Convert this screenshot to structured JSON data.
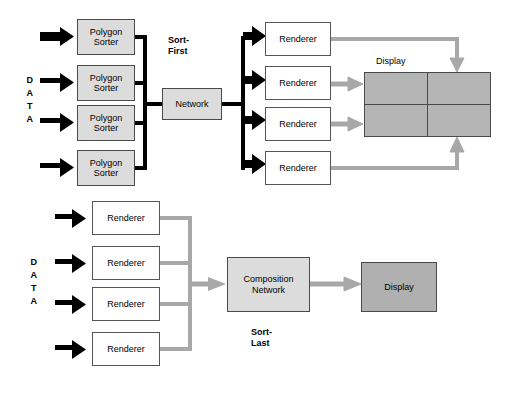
{
  "diagram": {
    "title_hidden": "",
    "colors": {
      "gray_fill": "#dcdcdc",
      "dark_gray_fill": "#b0b0b0",
      "white_fill": "#ffffff",
      "black_arrow": "#000000",
      "gray_arrow": "#a8a8a8",
      "border": "#4a4a4a"
    },
    "sort_first": {
      "label": "Sort-\nFirst",
      "label_line1": "Sort-",
      "label_line2": "First",
      "data_label": "D\nA\nT\nA",
      "data_letters": [
        "D",
        "A",
        "T",
        "A"
      ],
      "polygon_sorters": [
        {
          "line1": "Polygon",
          "line2": "Sorter"
        },
        {
          "line1": "Polygon",
          "line2": "Sorter"
        },
        {
          "line1": "Polygon",
          "line2": "Sorter"
        },
        {
          "line1": "Polygon",
          "line2": "Sorter"
        }
      ],
      "network": {
        "label": "Network"
      },
      "renderers": [
        {
          "label": "Renderer"
        },
        {
          "label": "Renderer"
        },
        {
          "label": "Renderer"
        },
        {
          "label": "Renderer"
        }
      ],
      "display": {
        "label": "Display",
        "tiles": 4,
        "rows": 2,
        "cols": 2
      }
    },
    "sort_last": {
      "label_line1": "Sort-",
      "label_line2": "Last",
      "data_letters": [
        "D",
        "A",
        "T",
        "A"
      ],
      "renderers": [
        {
          "label": "Renderer"
        },
        {
          "label": "Renderer"
        },
        {
          "label": "Renderer"
        },
        {
          "label": "Renderer"
        }
      ],
      "composition_network": {
        "line1": "Composition",
        "line2": "Network"
      },
      "display": {
        "label": "Display"
      }
    }
  }
}
